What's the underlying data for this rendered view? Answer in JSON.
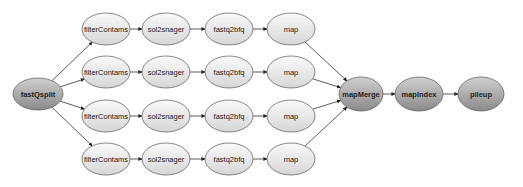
{
  "diagram": {
    "type": "workflow-graph",
    "nodes": [
      {
        "id": "fastQsplit",
        "label": "fastQsplit",
        "style": "dark"
      },
      {
        "id": "fc1",
        "label": "filterContams",
        "style": "light"
      },
      {
        "id": "fc2",
        "label": "filterContams",
        "style": "light"
      },
      {
        "id": "fc3",
        "label": "filterContams",
        "style": "light"
      },
      {
        "id": "fc4",
        "label": "filterContams",
        "style": "light"
      },
      {
        "id": "ss1",
        "label": "sol2snager",
        "style": "light"
      },
      {
        "id": "ss2",
        "label": "sol2snager",
        "style": "light"
      },
      {
        "id": "ss3",
        "label": "sol2snager",
        "style": "light"
      },
      {
        "id": "ss4",
        "label": "sol2snager",
        "style": "light"
      },
      {
        "id": "fb1",
        "label": "fastq2bfq",
        "style": "light"
      },
      {
        "id": "fb2",
        "label": "fastq2bfq",
        "style": "light"
      },
      {
        "id": "fb3",
        "label": "fastq2bfq",
        "style": "light"
      },
      {
        "id": "fb4",
        "label": "fastq2bfq",
        "style": "light"
      },
      {
        "id": "mp1",
        "label": "map",
        "style": "light"
      },
      {
        "id": "mp2",
        "label": "map",
        "style": "light"
      },
      {
        "id": "mp3",
        "label": "map",
        "style": "light"
      },
      {
        "id": "mp4",
        "label": "map",
        "style": "light"
      },
      {
        "id": "mapMerge",
        "label": "mapMerge",
        "style": "dark"
      },
      {
        "id": "mapIndex",
        "label": "mapIndex",
        "style": "dark"
      },
      {
        "id": "pileup",
        "label": "pileup",
        "style": "dark"
      }
    ],
    "edges": [
      [
        "fastQsplit",
        "fc1"
      ],
      [
        "fastQsplit",
        "fc2"
      ],
      [
        "fastQsplit",
        "fc3"
      ],
      [
        "fastQsplit",
        "fc4"
      ],
      [
        "fc1",
        "ss1"
      ],
      [
        "fc2",
        "ss2"
      ],
      [
        "fc3",
        "ss3"
      ],
      [
        "fc4",
        "ss4"
      ],
      [
        "ss1",
        "fb1"
      ],
      [
        "ss2",
        "fb2"
      ],
      [
        "ss3",
        "fb3"
      ],
      [
        "ss4",
        "fb4"
      ],
      [
        "fb1",
        "mp1"
      ],
      [
        "fb2",
        "mp2"
      ],
      [
        "fb3",
        "mp3"
      ],
      [
        "fb4",
        "mp4"
      ],
      [
        "mp1",
        "mapMerge"
      ],
      [
        "mp2",
        "mapMerge"
      ],
      [
        "mp3",
        "mapMerge"
      ],
      [
        "mp4",
        "mapMerge"
      ],
      [
        "mapMerge",
        "mapIndex"
      ],
      [
        "mapIndex",
        "pileup"
      ]
    ],
    "colors": {
      "dark_top": "#d0d0d0",
      "dark_bottom": "#8a8a8a",
      "light_top": "#fafafa",
      "light_bottom": "#d6d6d6",
      "edge": "#333333"
    }
  }
}
